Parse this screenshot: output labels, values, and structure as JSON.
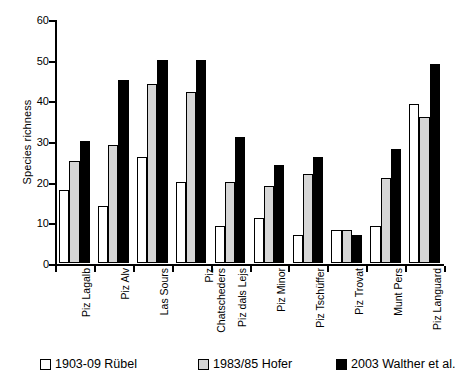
{
  "chart_data": {
    "type": "bar",
    "title": "",
    "xlabel": "",
    "ylabel": "Species richness",
    "ylim": [
      0,
      60
    ],
    "yticks": [
      0,
      10,
      20,
      30,
      40,
      50,
      60
    ],
    "grid": false,
    "legend_position": "bottom",
    "categories": [
      "Piz Lagalb",
      "Piz Alv",
      "Las Sours",
      "Piz Chatscheders",
      "Piz dals Lejs",
      "Piz Minor",
      "Piz Tschüffer",
      "Piz Trovat",
      "Munt Pers",
      "Piz Languard"
    ],
    "series": [
      {
        "name": "1903-09 Rübel",
        "color": "#ffffff",
        "values": [
          18,
          14,
          26,
          20,
          9,
          11,
          7,
          8,
          9,
          39
        ]
      },
      {
        "name": "1983/85 Hofer",
        "color": "#d6d6d6",
        "values": [
          25,
          29,
          44,
          42,
          20,
          19,
          22,
          8,
          21,
          36
        ]
      },
      {
        "name": "2003 Walther et al.",
        "color": "#000000",
        "values": [
          30,
          45,
          50,
          50,
          31,
          24,
          26,
          7,
          28,
          49
        ]
      }
    ]
  }
}
